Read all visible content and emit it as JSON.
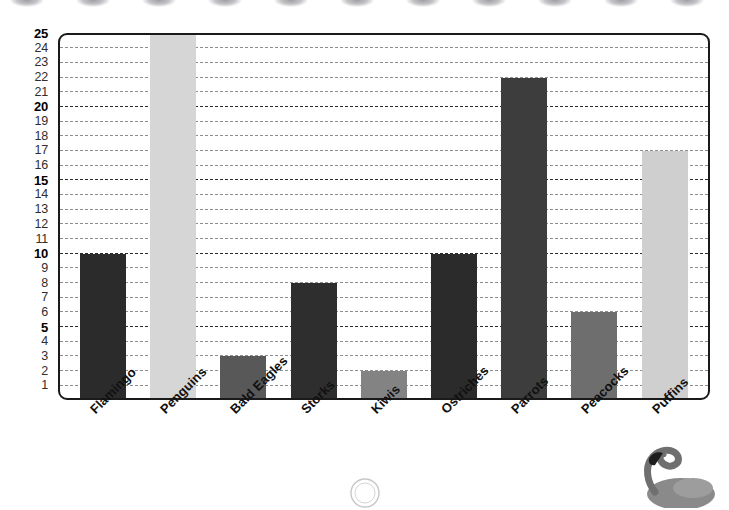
{
  "page": {
    "background": "#ffffff",
    "binding_marks": 11
  },
  "chart_data": {
    "type": "bar",
    "title": "",
    "subtitle": "",
    "xlabel": "",
    "ylabel": "",
    "categories": [
      "Flamingo",
      "Penguins",
      "Bald Eagles",
      "Storks",
      "Kiwis",
      "Ostriches",
      "Parrots",
      "Peacocks",
      "Puffins"
    ],
    "values": [
      10,
      25,
      3,
      8,
      2,
      10,
      22,
      6,
      17
    ],
    "bar_colors": [
      "#2b2b2b",
      "#d6d6d6",
      "#585858",
      "#2e2e2e",
      "#838383",
      "#2b2b2b",
      "#3d3d3d",
      "#6e6e6e",
      "#cfcfcf"
    ],
    "ylim": [
      0,
      25
    ],
    "y_ticks": [
      25,
      24,
      23,
      22,
      21,
      20,
      19,
      18,
      17,
      16,
      15,
      14,
      13,
      12,
      11,
      10,
      9,
      8,
      7,
      6,
      5,
      4,
      3,
      2,
      1
    ],
    "y_major_ticks": [
      25,
      20,
      15,
      10,
      5
    ],
    "grid": true,
    "grid_style": "dashed",
    "grid_color": "#8d8d8d",
    "grid_major_color": "#2b2b2b",
    "legend": "none",
    "frame_color": "#1a1a1a",
    "x_label_rotation": -45
  },
  "decor": {
    "flamingo_photo": "flamingo-photo",
    "stamp": "circular-stamp"
  }
}
